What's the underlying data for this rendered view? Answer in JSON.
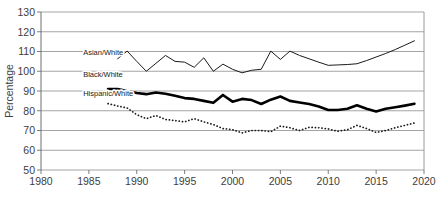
{
  "chart_data": {
    "type": "line",
    "title": "",
    "xlabel": "",
    "ylabel": "Percentage",
    "xlim": [
      1980,
      2020
    ],
    "ylim": [
      50,
      130
    ],
    "ytick_step": 10,
    "xtick_step": 5,
    "grid": true,
    "grid_axis": "y",
    "legend_position": "inline-left",
    "xticks": [
      "1980",
      "1985",
      "1990",
      "1995",
      "2000",
      "2005",
      "2010",
      "2015",
      "2020"
    ],
    "yticks": [
      "50",
      "60",
      "70",
      "80",
      "90",
      "100",
      "110",
      "120",
      "130"
    ],
    "series": [
      {
        "name": "Asian/White",
        "style": "thin-solid",
        "color": "#1a1a1a",
        "label_x": 1984.4,
        "label_y": 108.2,
        "x": [
          1988,
          1989,
          1990,
          1991,
          1992,
          1993,
          1994,
          1995,
          1996,
          1997,
          1998,
          1999,
          2000,
          2001,
          2002,
          2003,
          2004,
          2005,
          2006,
          2007,
          2008,
          2009,
          2010,
          2011,
          2012,
          2013,
          2014,
          2015,
          2016,
          2017,
          2018,
          2019
        ],
        "values": [
          106.3,
          110.2,
          105.0,
          100.0,
          104.0,
          108.0,
          105.0,
          104.6,
          102.0,
          106.8,
          100.0,
          103.6,
          101.0,
          99.2,
          100.5,
          101.0,
          110.2,
          106.0,
          110.2,
          108.0,
          106.3,
          104.6,
          103.0,
          103.2,
          103.4,
          103.8,
          105.4,
          107.2,
          109.0,
          111.0,
          113.2,
          115.4
        ]
      },
      {
        "name": "Black/White",
        "style": "thick-solid",
        "color": "#000000",
        "label_x": 1984.4,
        "label_y": 97.0,
        "x": [
          1987,
          1988,
          1989,
          1990,
          1991,
          1992,
          1993,
          1994,
          1995,
          1996,
          1997,
          1998,
          1999,
          2000,
          2001,
          2002,
          2003,
          2004,
          2005,
          2006,
          2007,
          2008,
          2009,
          2010,
          2011,
          2012,
          2013,
          2014,
          2015,
          2016,
          2017,
          2018,
          2019
        ],
        "values": [
          91.0,
          91.0,
          90.0,
          89.0,
          88.4,
          89.2,
          88.6,
          87.6,
          86.4,
          86.0,
          85.0,
          84.0,
          88.0,
          84.6,
          86.0,
          85.4,
          83.4,
          85.6,
          87.2,
          85.0,
          84.2,
          83.4,
          82.2,
          80.4,
          80.4,
          81.0,
          82.8,
          81.0,
          79.6,
          81.0,
          81.8,
          82.6,
          83.5
        ]
      },
      {
        "name": "Hispanic/White",
        "style": "dotted",
        "color": "#1a1a1a",
        "label_x": 1984.4,
        "label_y": 87.6,
        "x": [
          1987,
          1988,
          1989,
          1990,
          1991,
          1992,
          1993,
          1994,
          1995,
          1996,
          1997,
          1998,
          1999,
          2000,
          2001,
          2002,
          2003,
          2004,
          2005,
          2006,
          2007,
          2008,
          2009,
          2010,
          2011,
          2012,
          2013,
          2014,
          2015,
          2016,
          2017,
          2018,
          2019
        ],
        "values": [
          83.6,
          82.4,
          81.4,
          78.0,
          76.0,
          77.6,
          75.6,
          75.0,
          74.4,
          76.0,
          74.4,
          73.0,
          71.0,
          70.4,
          68.8,
          70.0,
          70.0,
          69.4,
          72.2,
          71.4,
          70.0,
          71.6,
          71.4,
          70.8,
          69.6,
          70.4,
          72.6,
          71.0,
          69.0,
          70.0,
          71.4,
          72.6,
          73.8
        ]
      }
    ]
  },
  "axis": {
    "y_title": "Percentage"
  },
  "footnote": {
    "text": ""
  }
}
